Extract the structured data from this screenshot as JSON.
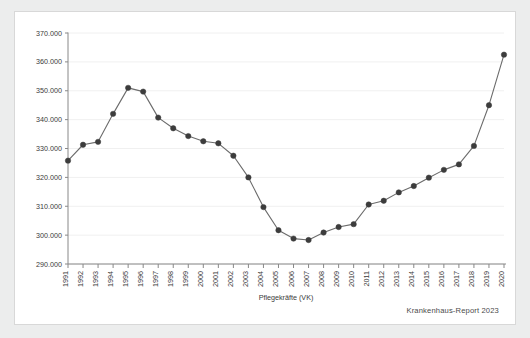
{
  "card": {
    "background": "#ffffff",
    "border_color": "#d8d8d8"
  },
  "source_note": "Krankenhaus-Report 2023",
  "chart_data": {
    "type": "line",
    "title": "",
    "xlabel": "Pflegekräfte (VK)",
    "ylabel": "",
    "grid": true,
    "legend": null,
    "marker": "circle",
    "line_color": "#6b6b6b",
    "marker_color": "#3c3c3c",
    "grid_color": "#f0f0f0",
    "axis_color": "#888888",
    "ylim": [
      290000,
      370000
    ],
    "ytick_step": 10000,
    "ytick_labels": [
      "290.000",
      "300.000",
      "310.000",
      "320.000",
      "330.000",
      "340.000",
      "350.000",
      "360.000",
      "370.000"
    ],
    "ytick_values": [
      290000,
      300000,
      310000,
      320000,
      330000,
      340000,
      350000,
      360000,
      370000
    ],
    "categories": [
      "1991",
      "1992",
      "1993",
      "1994",
      "1995",
      "1996",
      "1997",
      "1998",
      "1999",
      "2000",
      "2001",
      "2002",
      "2003",
      "2004",
      "2005",
      "2006",
      "2007",
      "2008",
      "2009",
      "2010",
      "2011",
      "2012",
      "2013",
      "2014",
      "2015",
      "2016",
      "2017",
      "2018",
      "2019",
      "2020"
    ],
    "values": [
      325800,
      331300,
      332300,
      342000,
      351000,
      349700,
      340700,
      337000,
      334300,
      332500,
      331800,
      327500,
      320000,
      309700,
      301700,
      298800,
      298300,
      300900,
      302800,
      303800,
      310600,
      311900,
      314800,
      317000,
      319900,
      322600,
      324500,
      330900,
      345000,
      362500
    ]
  }
}
